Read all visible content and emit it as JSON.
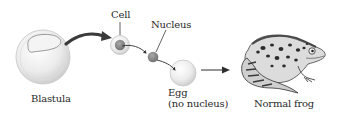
{
  "diagram": {
    "labels": {
      "blastula": "Blastula",
      "cell": "Cell",
      "nucleus": "Nucleus",
      "egg": "Egg",
      "egg_note": "(no nucleus)",
      "frog": "Normal frog"
    },
    "colors": {
      "background": "#ffffff",
      "cell_fill": "#e6e6e6",
      "cell_outline": "#bdbdbd",
      "nucleus_fill": "#8a8a8a",
      "arrow": "#3a3a3a",
      "text": "#2a2a2a"
    },
    "steps": [
      {
        "from": "blastula",
        "to": "cell",
        "connector": "curved-arrow"
      },
      {
        "from": "cell",
        "to": "nucleus",
        "connector": "curved-line"
      },
      {
        "from": "nucleus",
        "to": "egg",
        "connector": "curved-arrow"
      },
      {
        "from": "egg",
        "to": "frog",
        "connector": "straight-arrow"
      }
    ]
  }
}
